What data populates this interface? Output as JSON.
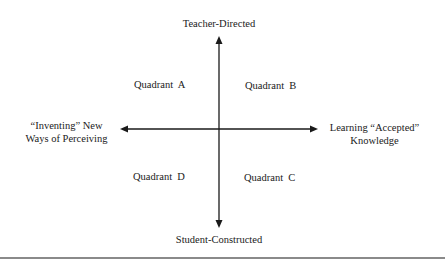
{
  "diagram": {
    "type": "quadrant",
    "axes": {
      "vertical": {
        "top_label": "Teacher-Directed",
        "bottom_label": "Student-Constructed"
      },
      "horizontal": {
        "left_label": [
          "“Inventing” New",
          "Ways of Perceiving"
        ],
        "right_label": [
          "Learning “Accepted”",
          "Knowledge"
        ]
      }
    },
    "quadrants": {
      "top_left": "Quadrant  A",
      "top_right": "Quadrant  B",
      "bottom_right": "Quadrant  C",
      "bottom_left": "Quadrant  D"
    },
    "colors": {
      "line": "#1a1a1a",
      "text": "#1a1a1a",
      "rule": "#8a8a8a"
    }
  }
}
